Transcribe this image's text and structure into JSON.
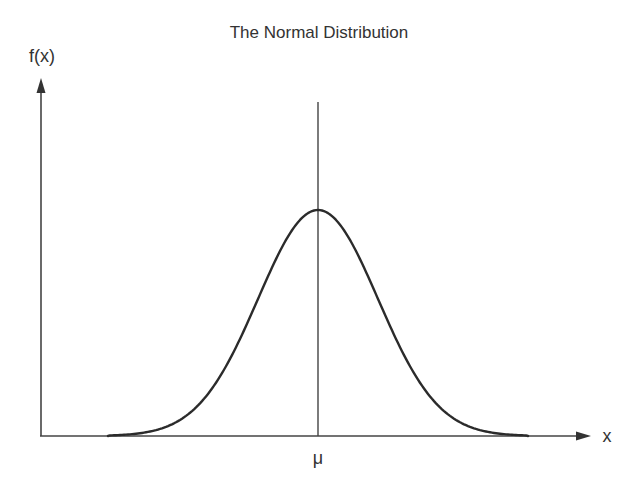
{
  "chart_data": {
    "type": "line",
    "title": "The Normal Distribution",
    "xlabel": "x",
    "ylabel": "f(x)",
    "x_tick_labels": [
      "μ"
    ],
    "annotations": [
      {
        "type": "vertical-line",
        "at": "μ",
        "label": "μ"
      }
    ],
    "series": [
      {
        "name": "normal density curve",
        "distribution": "normal",
        "mean_label": "μ",
        "x_in_sd_units": [
          -3.5,
          -3,
          -2.5,
          -2,
          -1.5,
          -1,
          -0.5,
          0,
          0.5,
          1,
          1.5,
          2,
          2.5,
          3,
          3.5
        ],
        "relative_density": [
          0.002,
          0.011,
          0.044,
          0.135,
          0.325,
          0.607,
          0.882,
          1.0,
          0.882,
          0.607,
          0.325,
          0.135,
          0.044,
          0.011,
          0.002
        ]
      }
    ],
    "grid": false,
    "legend": "none",
    "axis_style": "arrows, no numeric ticks",
    "colors": {
      "line": "#2b2b2b",
      "axes": "#444444",
      "text": "#333333",
      "background": "#ffffff"
    }
  }
}
